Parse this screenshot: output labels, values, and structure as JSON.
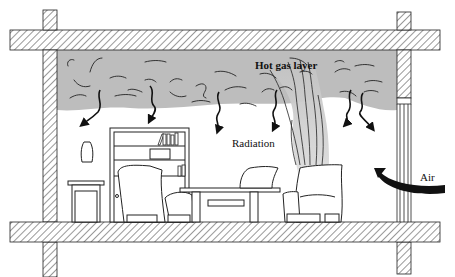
{
  "diagram": {
    "type": "cross-section illustration",
    "labels": {
      "hot_gas_layer": "Hot gas layer",
      "radiation": "Radiation",
      "air": "Air"
    },
    "elements": [
      {
        "id": "ceiling-slab",
        "kind": "hatched structure"
      },
      {
        "id": "floor-slab",
        "kind": "hatched structure"
      },
      {
        "id": "left-wall",
        "kind": "hatched structure"
      },
      {
        "id": "right-wall",
        "kind": "hatched structure"
      },
      {
        "id": "doorway-opening",
        "kind": "opening with frame lines"
      },
      {
        "id": "hot-gas-layer",
        "kind": "gray smoke region"
      },
      {
        "id": "fire-plume",
        "kind": "rising plume from armchair"
      },
      {
        "id": "radiation-arrows",
        "kind": "wavy arrows",
        "count": 6
      },
      {
        "id": "air-arrow",
        "kind": "curved arrow entering from right"
      },
      {
        "id": "bookshelf",
        "kind": "furniture"
      },
      {
        "id": "side-table-with-vase",
        "kind": "furniture"
      },
      {
        "id": "armchair-left",
        "kind": "furniture"
      },
      {
        "id": "armchair-middle",
        "kind": "furniture"
      },
      {
        "id": "armchair-burning",
        "kind": "furniture"
      },
      {
        "id": "coffee-table",
        "kind": "furniture"
      }
    ],
    "colors": {
      "smoke": "#bdbdbd",
      "line": "#1a1a1a",
      "background": "#ffffff"
    }
  }
}
